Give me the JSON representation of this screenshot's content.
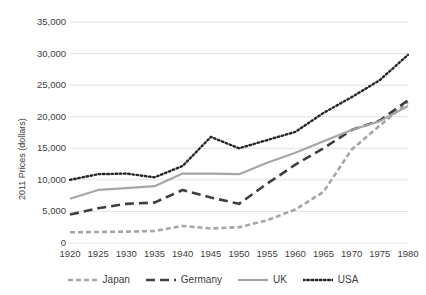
{
  "chart_data": {
    "type": "line",
    "title": "",
    "xlabel": "",
    "ylabel": "2011 Prices (dollars)",
    "x": [
      1920,
      1925,
      1930,
      1935,
      1940,
      1945,
      1950,
      1955,
      1960,
      1965,
      1970,
      1975,
      1980
    ],
    "categories": [
      "1920",
      "1925",
      "1930",
      "1935",
      "1940",
      "1945",
      "1950",
      "1955",
      "1960",
      "1965",
      "1970",
      "1975",
      "1980"
    ],
    "xlim": [
      1920,
      1980
    ],
    "ylim": [
      0,
      35000
    ],
    "yticks": [
      0,
      5000,
      10000,
      15000,
      20000,
      25000,
      30000,
      35000
    ],
    "ytick_labels": [
      "0",
      "5,000",
      "10,000",
      "15,000",
      "20,000",
      "25,000",
      "30,000",
      "35,000"
    ],
    "grid": true,
    "legend_position": "bottom",
    "series": [
      {
        "name": "Japan",
        "color": "#a6a6a6",
        "dash": "short-dash",
        "values": [
          1700,
          1750,
          1800,
          1900,
          2700,
          2300,
          2500,
          3600,
          5300,
          8100,
          14800,
          18600,
          22300
        ]
      },
      {
        "name": "Germany",
        "color": "#3f3f3f",
        "dash": "long-dash",
        "values": [
          4500,
          5500,
          6200,
          6400,
          8400,
          7200,
          6200,
          9400,
          12400,
          15000,
          17900,
          19400,
          22600
        ]
      },
      {
        "name": "UK",
        "color": "#a6a6a6",
        "dash": "solid",
        "values": [
          7000,
          8400,
          8700,
          9000,
          11000,
          11000,
          10900,
          12700,
          14300,
          16100,
          17900,
          19300,
          21700
        ]
      },
      {
        "name": "USA",
        "color": "#262626",
        "dash": "dotted",
        "values": [
          10000,
          10900,
          11000,
          10400,
          12200,
          16800,
          15000,
          16300,
          17600,
          20600,
          23100,
          25800,
          29800
        ]
      }
    ]
  },
  "legend": {
    "items": [
      {
        "label": "Japan"
      },
      {
        "label": "Germany"
      },
      {
        "label": "UK"
      },
      {
        "label": "USA"
      }
    ]
  },
  "colors": {
    "grid": "#e2e2e2",
    "text": "#3d3d3d",
    "japan": "#a6a6a6",
    "germany": "#3f3f3f",
    "uk": "#a6a6a6",
    "usa": "#262626",
    "background": "#ffffff"
  }
}
